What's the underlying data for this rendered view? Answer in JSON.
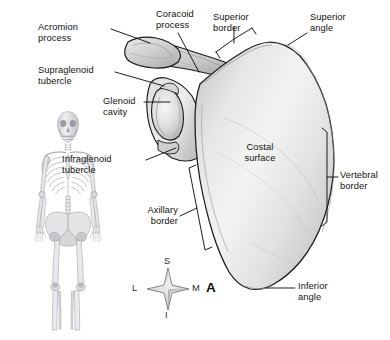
{
  "figure": {
    "panel_letter": "A",
    "background_color": "#ffffff",
    "line_color": "#1a1a1a",
    "bone_fill_light": "#f4f4f2",
    "bone_fill_mid": "#d9d9d7",
    "bone_fill_shadow": "#b9b9b7",
    "label_color": "#121212"
  },
  "labels": {
    "acromion_process": "Acromion\nprocess",
    "supraglenoid_tubercle": "Supraglenoid\ntubercle",
    "glenoid_cavity": "Glenoid\ncavity",
    "infraglenoid_tubercle": "Infraglenoid\ntubercle",
    "coracoid_process": "Coracoid\nprocess",
    "superior_border": "Superior\nborder",
    "superior_angle": "Superior\nangle",
    "costal_surface": "Costal\nsurface",
    "vertebral_border": "Vertebral\nborder",
    "axillary_border": "Axillary\nborder",
    "inferior_angle": "Inferior\nangle"
  },
  "compass": {
    "superior": "S",
    "inferior": "I",
    "lateral": "L",
    "medial": "M"
  },
  "orientation_key": {
    "name": "anatomical-direction-rose",
    "axes": [
      "S",
      "I",
      "L",
      "M"
    ]
  }
}
